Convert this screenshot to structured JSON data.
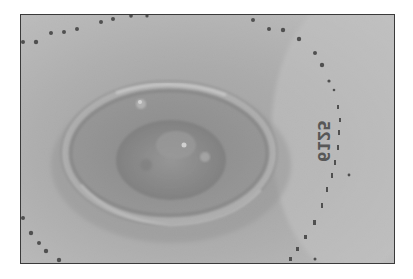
{
  "image": {
    "kind": "grayscale clinical photograph",
    "subject": "oval raised skin lesion with rolled beaded border, surrounded by dotted surgical marker lines",
    "marker_annotation": "6125",
    "colors": {
      "background_page": "#ffffff",
      "frame_border": "#3a3a3a",
      "skin_light": "#c4c4c4",
      "skin_mid": "#a8a8a8",
      "lesion_dark": "#6e6e6e",
      "marker_dots": "#1e1e1e"
    }
  }
}
